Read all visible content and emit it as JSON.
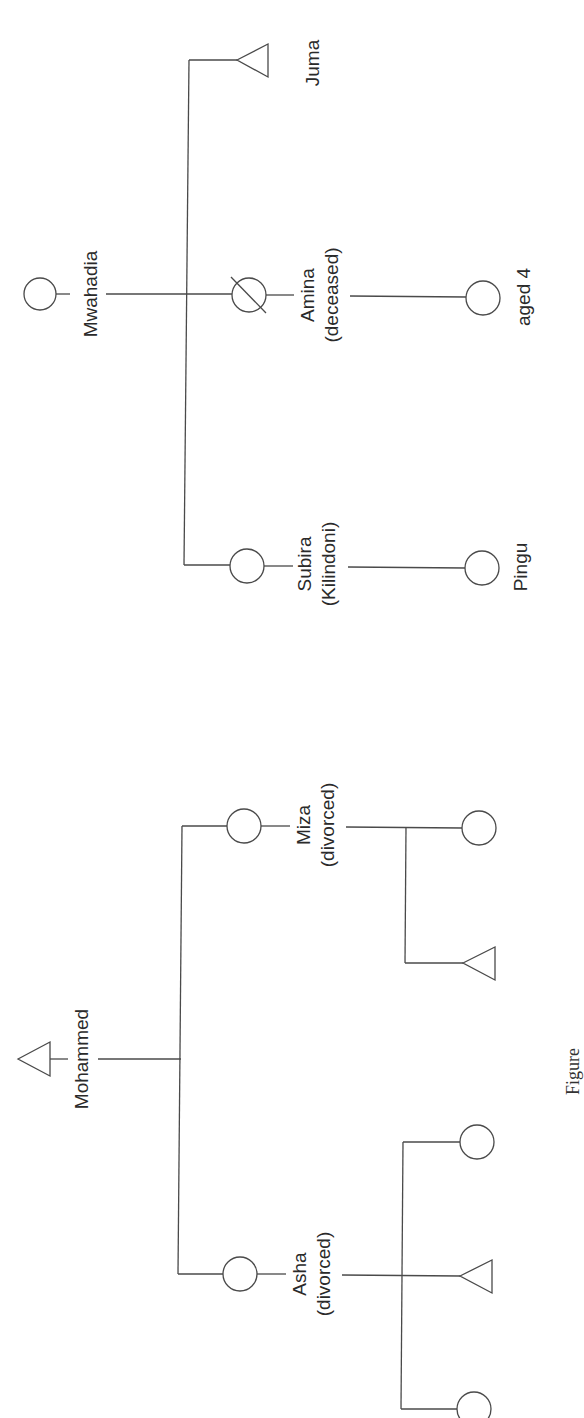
{
  "diagram": {
    "type": "kinship-chart",
    "orientation": "rotated-90-ccw",
    "stroke_color": "#4a4a4a",
    "text_color": "#2a2a2a",
    "groups": [
      {
        "parent": {
          "name": "Mwahadia",
          "sex": "female",
          "note": ""
        },
        "children": [
          {
            "name": "Juma",
            "sex": "male",
            "note": "",
            "children": []
          },
          {
            "name": "Amina",
            "sex": "female",
            "note": "(deceased)",
            "deceased": true,
            "children": [
              {
                "name": "aged 4",
                "sex": "female"
              }
            ]
          },
          {
            "name": "Subira",
            "sex": "female",
            "note": "(Kilindoni)",
            "children": [
              {
                "name": "Pingu",
                "sex": "female"
              }
            ]
          }
        ]
      },
      {
        "parent": {
          "name": "Mohammed",
          "sex": "male",
          "note": ""
        },
        "children": [
          {
            "name": "Miza",
            "sex": "female",
            "note": "(divorced)",
            "children": [
              {
                "name": "",
                "sex": "female"
              },
              {
                "name": "",
                "sex": "male"
              }
            ]
          },
          {
            "name": "Asha",
            "sex": "female",
            "note": "(divorced)",
            "children": [
              {
                "name": "",
                "sex": "female"
              },
              {
                "name": "",
                "sex": "male"
              },
              {
                "name": "",
                "sex": "female"
              }
            ]
          }
        ]
      }
    ]
  },
  "labels": {
    "mwahadia": {
      "line1": "Mwahadia"
    },
    "juma": {
      "line1": "Juma"
    },
    "amina": {
      "line1": "Amina",
      "line2": "(deceased)"
    },
    "aged4": {
      "line1": "aged 4"
    },
    "subira": {
      "line1": "Subira",
      "line2": "(Kilindoni)"
    },
    "pingu": {
      "line1": "Pingu"
    },
    "mohammed": {
      "line1": "Mohammed"
    },
    "miza": {
      "line1": "Miza",
      "line2": "(divorced)"
    },
    "asha": {
      "line1": "Asha",
      "line2": "(divorced)"
    }
  },
  "caption": {
    "text": "Figure"
  }
}
